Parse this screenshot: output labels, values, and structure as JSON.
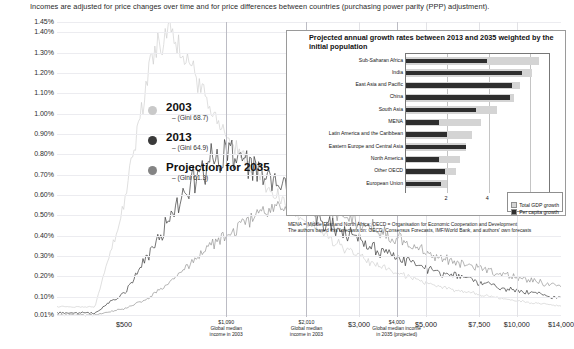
{
  "header": {
    "note": "Incomes are adjusted for price changes over time and for price differences between countries (purchasing power parity (PPP) adjustment)."
  },
  "main_chart": {
    "ylabel": "% of the world population at a given income level",
    "yticks": [
      "1.45%",
      "1.40%",
      "1.30%",
      "1.20%",
      "1.10%",
      "1.00%",
      "0.90%",
      "0.80%",
      "0.70%",
      "0.60%",
      "0.50%",
      "0.40%",
      "0.30%",
      "0.20%",
      "0.10%",
      "0.01%"
    ],
    "xticks_major": [
      "$500",
      "$3,000",
      "$5,000",
      "$7,500",
      "$10,000",
      "$14,000"
    ],
    "xticks_minor": [
      "$1,090",
      "$2,010",
      "$4,000"
    ],
    "annotations": [
      {
        "value": "$1,090",
        "line1": "Global median",
        "line2": "income in 2003"
      },
      {
        "value": "$2,010",
        "line1": "Global median",
        "line2": "income in 2003"
      },
      {
        "value": "$4,000",
        "line1": "Global median income",
        "line2": "in 2035 (projected)"
      }
    ],
    "legend": [
      {
        "name": "2003",
        "gini": "– (Gini 68.7)",
        "color": "#c9c9c9"
      },
      {
        "name": "2013",
        "gini": "– (Gini 64.9)",
        "color": "#3a3a3a"
      },
      {
        "name": "Projection for 2035",
        "gini": "– (Gini 61.3)",
        "color": "#848484"
      }
    ]
  },
  "chart_data": [
    {
      "type": "line",
      "title": "World income distribution",
      "xlabel": "",
      "ylabel": "% of the world population at a given income level",
      "ylim": [
        0.0,
        1.45
      ],
      "xlim": [
        300,
        14000
      ],
      "xscale": "log-ish",
      "grid": true,
      "x": [
        400,
        500,
        600,
        700,
        800,
        900,
        1000,
        1090,
        1200,
        1400,
        1600,
        1800,
        2010,
        2300,
        2600,
        3000,
        3400,
        3800,
        4000,
        4500,
        5000,
        5600,
        6300,
        7000,
        7500,
        8200,
        9000,
        10000,
        11000,
        12000,
        13000,
        14000
      ],
      "series": [
        {
          "name": "2003",
          "gini": 68.7,
          "color": "#c9c9c9",
          "values": [
            0.05,
            0.55,
            1.2,
            1.43,
            1.3,
            1.12,
            0.98,
            0.9,
            0.82,
            0.7,
            0.6,
            0.52,
            0.46,
            0.4,
            0.35,
            0.3,
            0.26,
            0.23,
            0.22,
            0.19,
            0.17,
            0.15,
            0.13,
            0.12,
            0.11,
            0.1,
            0.09,
            0.08,
            0.07,
            0.065,
            0.06,
            0.055
          ]
        },
        {
          "name": "2013",
          "gini": 64.9,
          "color": "#3a3a3a",
          "values": [
            0.02,
            0.12,
            0.3,
            0.48,
            0.63,
            0.73,
            0.79,
            0.8,
            0.78,
            0.72,
            0.66,
            0.6,
            0.55,
            0.48,
            0.43,
            0.38,
            0.34,
            0.31,
            0.3,
            0.27,
            0.24,
            0.22,
            0.2,
            0.18,
            0.17,
            0.16,
            0.14,
            0.13,
            0.12,
            0.11,
            0.1,
            0.09
          ]
        },
        {
          "name": "Projection for 2035",
          "gini": 61.3,
          "color": "#848484",
          "values": [
            0.01,
            0.04,
            0.09,
            0.16,
            0.24,
            0.31,
            0.37,
            0.4,
            0.44,
            0.5,
            0.53,
            0.55,
            0.55,
            0.53,
            0.5,
            0.46,
            0.43,
            0.4,
            0.39,
            0.35,
            0.32,
            0.29,
            0.27,
            0.25,
            0.24,
            0.22,
            0.21,
            0.19,
            0.18,
            0.17,
            0.16,
            0.15
          ]
        }
      ]
    },
    {
      "type": "bar",
      "orientation": "horizontal",
      "title": "Projected annual growth rates between 2013 and 2035 weighted by the initial population",
      "xlabel": "percent",
      "xlim": [
        0,
        7
      ],
      "xticks": [
        2,
        4,
        6
      ],
      "grid": true,
      "categories": [
        "Sub-Saharan Africa",
        "India",
        "East Asia and Pacific",
        "China",
        "South Asia",
        "MENA",
        "Latin America and the Caribbean",
        "Eastern Europe and Central Asia",
        "North America",
        "Other OECD",
        "European Union"
      ],
      "series": [
        {
          "name": "Total GDP growth",
          "color": "#d4d4d4",
          "values": [
            6.4,
            6.1,
            5.5,
            5.2,
            4.4,
            3.6,
            3.2,
            2.9,
            2.6,
            2.4,
            2.0
          ]
        },
        {
          "name": "Per capita growth",
          "color": "#2e2e2e",
          "values": [
            3.9,
            5.6,
            5.1,
            5.0,
            3.4,
            1.6,
            2.0,
            2.9,
            1.6,
            1.9,
            1.7
          ]
        }
      ],
      "legend_position": "bottom-right"
    }
  ],
  "inset": {
    "title": "Projected annual growth rates between 2013 and 2035 weighted by the initial population",
    "axis_name": "percent",
    "xticks": [
      "2",
      "4",
      "6"
    ],
    "legend": [
      {
        "label": "Total GDP growth",
        "color": "#d4d4d4"
      },
      {
        "label": "Per capita growth",
        "color": "#2e2e2e"
      }
    ],
    "footnote_line1": "MENA = Middle East and North Africa; OECD = Organisation for Economic Cooperation and Development",
    "footnote_line2": "The authors based this forecasts on: OECD, Consensus Forecasts, IMF/World Bank, and authors' own forecasts"
  }
}
